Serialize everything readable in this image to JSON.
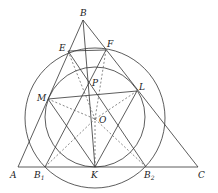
{
  "diagram": {
    "points": {
      "A": {
        "label": "A",
        "x": 18,
        "y": 167
      },
      "B": {
        "label": "B",
        "x": 83,
        "y": 20
      },
      "C": {
        "label": "C",
        "x": 198,
        "y": 167
      },
      "E": {
        "label": "E",
        "x": 68,
        "y": 51
      },
      "F": {
        "label": "F",
        "x": 106,
        "y": 50
      },
      "P": {
        "label": "P",
        "x": 89,
        "y": 84
      },
      "M": {
        "label": "M",
        "x": 48,
        "y": 99
      },
      "L": {
        "label": "L",
        "x": 137,
        "y": 91
      },
      "O": {
        "label": "O",
        "x": 95,
        "y": 119
      },
      "K": {
        "label": "K",
        "x": 95,
        "y": 167
      },
      "B1": {
        "label": "B",
        "sub": "1",
        "x": 45,
        "y": 167
      },
      "B2": {
        "label": "B",
        "sub": "2",
        "x": 146,
        "y": 167
      }
    },
    "circles": {
      "outer": {
        "cx": 95,
        "cy": 118,
        "r": 70
      },
      "inner": {
        "cx": 95,
        "cy": 117,
        "r": 50
      }
    },
    "colors": {
      "stroke": "#333333",
      "dash": "#555555"
    }
  }
}
